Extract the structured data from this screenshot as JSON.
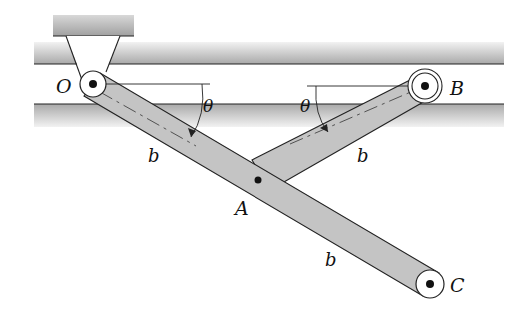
{
  "diagram": {
    "type": "mechanism",
    "labels": {
      "O": "O",
      "A": "A",
      "B": "B",
      "C": "C",
      "theta_left": "θ",
      "theta_right": "θ",
      "b_OA": "b",
      "b_AB": "b",
      "b_AC": "b"
    },
    "points": {
      "O": [
        93,
        84
      ],
      "A": [
        258,
        180
      ],
      "B": [
        425,
        86
      ],
      "C": [
        430,
        284
      ]
    },
    "colors": {
      "bar_fill": "#c4c4c4",
      "rail_fill": "#b8b8b8",
      "outline": "#222222"
    }
  }
}
